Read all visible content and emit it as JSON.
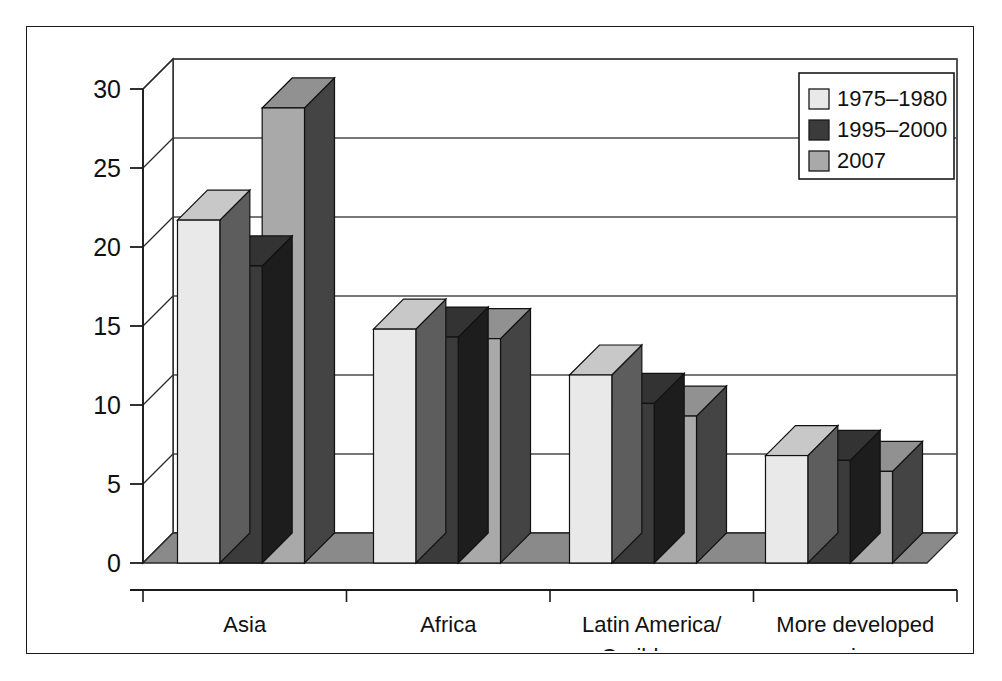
{
  "chart_data": {
    "type": "bar",
    "title": "",
    "subtitle": "",
    "xlabel": "",
    "ylabel": "",
    "categories": [
      "Asia",
      "Africa",
      "Latin America/\nCaribbean",
      "More developed\nregions"
    ],
    "category_lines": [
      [
        "Asia"
      ],
      [
        "Africa"
      ],
      [
        "Latin America/",
        "Caribbean"
      ],
      [
        "More developed",
        "regions"
      ]
    ],
    "series": [
      {
        "name": "1975–1980",
        "color": "#e9e9e9",
        "values": [
          21.7,
          14.8,
          11.9,
          6.8
        ]
      },
      {
        "name": "1995–2000",
        "color": "#3b3b3b",
        "values": [
          18.8,
          14.3,
          10.1,
          6.5
        ]
      },
      {
        "name": "2007",
        "color": "#a9a9a9",
        "values": [
          28.8,
          14.2,
          9.3,
          5.8
        ]
      }
    ],
    "ylim": [
      0,
      30
    ],
    "yticks": [
      0,
      5,
      10,
      15,
      20,
      25,
      30
    ],
    "ytick_labels": [
      "0",
      "5",
      "10",
      "15",
      "20",
      "25",
      "30"
    ],
    "grid": true,
    "grid_axis": "y",
    "legend_position": "top-right",
    "style": "3d-bars",
    "background": "#ffffff",
    "axis_color": "#1a1a1a",
    "grid_color": "#4a4a4a"
  },
  "legend": {
    "items": [
      {
        "label": "1975–1980",
        "swatch": "#e9e9e9"
      },
      {
        "label": "1995–2000",
        "swatch": "#3b3b3b"
      },
      {
        "label": "2007",
        "swatch": "#a9a9a9"
      }
    ]
  },
  "colors": {
    "light_face": "#e9e9e9",
    "light_top": "#d2d2d2",
    "light_side": "#5a5a5a",
    "dark_face": "#3b3b3b",
    "dark_top": "#5e5e5e",
    "dark_side": "#1d1d1d",
    "mid_face": "#a9a9a9",
    "mid_top": "#8d8d8d",
    "mid_side": "#3b3b3b",
    "floor": "#8a8a8a",
    "frame": "#1a1a1a"
  }
}
